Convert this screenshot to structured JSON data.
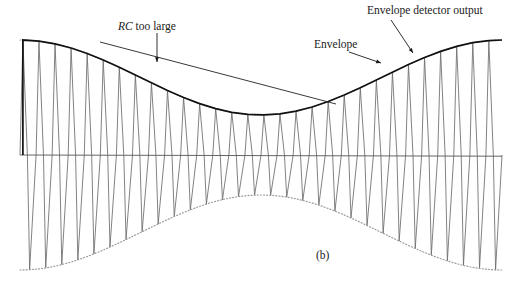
{
  "figure": {
    "caption": "(b)",
    "labels": {
      "rc_too_large_prefix": "RC",
      "rc_too_large_suffix": " too large",
      "envelope": "Envelope",
      "envelope_detector_output": "Envelope detector output"
    },
    "colors": {
      "carrier": "#6b6b6b",
      "detector_output": "#111111",
      "envelope_dotted": "#9a9a9a",
      "axis": "#555555",
      "rc_line": "#222222",
      "text": "#1a1a1a"
    }
  },
  "chart_data": {
    "type": "line",
    "title": "(b)",
    "xlabel": "",
    "ylabel": "",
    "xlim": [
      20,
      502
    ],
    "ylim": [
      288,
      0
    ],
    "grid": false,
    "legend": "none",
    "annotations": [
      {
        "text": "RC too large",
        "label_x": 118,
        "label_y": 20,
        "arrow_from": [
          157,
          33
        ],
        "arrow_to": [
          157,
          62
        ]
      },
      {
        "text": "Envelope",
        "label_x": 314,
        "label_y": 38,
        "arrow_from": [
          349,
          52
        ],
        "arrow_to": [
          381,
          63
        ]
      },
      {
        "text": "Envelope detector output",
        "label_x": 367,
        "label_y": 4,
        "arrow_from": [
          391,
          20
        ],
        "arrow_to": [
          413,
          53
        ]
      }
    ],
    "axis_line": {
      "y": 155,
      "x_start": 20,
      "x_end": 502
    },
    "envelope": {
      "description": "Upper and lower AM envelope: cosine-modulated amplitude",
      "baseline_y": 155,
      "amplitude_max": 115,
      "amplitude_min": 40,
      "modulation_cycles": 1.0,
      "modulation_phase_deg": 0,
      "x_start": 20,
      "x_end": 502,
      "style": "dotted",
      "upper_peak_y_left": 40,
      "upper_trough_y_center": 116,
      "upper_peak_y_right": 40,
      "lower_peak_y_left": 270,
      "lower_trough_y_center": 194,
      "lower_peak_y_right": 270
    },
    "carrier": {
      "description": "Fast sinusoidal carrier drawn as near-triangular peaks filling the envelope",
      "cycles": 30,
      "x_start": 20,
      "x_end": 502,
      "style": "thin-solid"
    },
    "detector_output": {
      "description": "Envelope detector output: charges to carrier peak then discharges with RC slope",
      "style": "bold-solid",
      "rc_discharge_slope_px_per_cycle": 9,
      "segments_count": 30
    },
    "rc_too_large_line": {
      "description": "Straight slow-discharge line showing RC time constant too long to follow envelope",
      "from": [
        100,
        42
      ],
      "to": [
        336,
        104
      ],
      "style": "solid"
    }
  }
}
